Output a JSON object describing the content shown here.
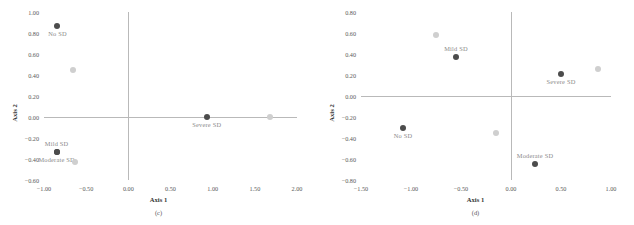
{
  "figure": {
    "panels": [
      {
        "caption": "(c)",
        "xlabel": "Axis 1",
        "ylabel": "Axis 2",
        "xticks": [
          "-1.00",
          "-0.50",
          "0.00",
          "0.50",
          "1.00",
          "1.50",
          "2.00"
        ],
        "yticks": [
          "1.00",
          "0.80",
          "0.60",
          "0.40",
          "0.20",
          "0.00",
          "-0.20",
          "-0.40",
          "-0.60"
        ]
      },
      {
        "caption": "(d)",
        "xlabel": "Axis 1",
        "ylabel": "Axis 2",
        "xticks": [
          "-1.50",
          "-1.00",
          "-0.50",
          "0.00",
          "0.50",
          "1.00"
        ],
        "yticks": [
          "0.80",
          "0.60",
          "0.40",
          "0.20",
          "0.00",
          "-0.20",
          "-0.40",
          "-0.60",
          "-0.80"
        ]
      }
    ]
  },
  "chart_data": [
    {
      "type": "scatter",
      "title": "",
      "subtitle": "(c)",
      "xlabel": "Axis 1",
      "ylabel": "Axis 2",
      "xlim": [
        -1.0,
        2.0
      ],
      "ylim": [
        -0.6,
        1.0
      ],
      "xticks": [
        -1.0,
        -0.5,
        0.0,
        0.5,
        1.0,
        1.5,
        2.0
      ],
      "yticks": [
        1.0,
        0.8,
        0.6,
        0.4,
        0.2,
        0.0,
        -0.2,
        -0.4,
        -0.6
      ],
      "grid": false,
      "legend": "none",
      "series": [
        {
          "name": "SD category",
          "marker": "filled-circle",
          "color": "#4c4c4c",
          "points": [
            {
              "label": "No SD",
              "x": -0.84,
              "y": 0.87,
              "label_pos": "below"
            },
            {
              "label": "Mild SD",
              "x": -0.85,
              "y": -0.33,
              "label_pos": "above"
            },
            {
              "label": "Moderate SD",
              "x": -0.85,
              "y": -0.33,
              "label_pos": "below"
            },
            {
              "label": "Severe SD",
              "x": 0.93,
              "y": 0.0,
              "label_pos": "below"
            }
          ]
        },
        {
          "name": "Unlabeled points",
          "marker": "filled-circle",
          "color": "#cfcfcf",
          "points": [
            {
              "label": "",
              "x": -0.66,
              "y": 0.45,
              "label_pos": "below"
            },
            {
              "label": "",
              "x": -0.63,
              "y": -0.43,
              "label_pos": "below"
            },
            {
              "label": "",
              "x": 1.68,
              "y": 0.0,
              "label_pos": "below"
            }
          ]
        }
      ]
    },
    {
      "type": "scatter",
      "title": "",
      "subtitle": "(d)",
      "xlabel": "Axis 1",
      "ylabel": "Axis 2",
      "xlim": [
        -1.5,
        1.0
      ],
      "ylim": [
        -0.8,
        0.8
      ],
      "xticks": [
        -1.5,
        -1.0,
        -0.5,
        0.0,
        0.5,
        1.0
      ],
      "yticks": [
        0.8,
        0.6,
        0.4,
        0.2,
        0.0,
        -0.2,
        -0.4,
        -0.6,
        -0.8
      ],
      "grid": false,
      "legend": "none",
      "series": [
        {
          "name": "SD category",
          "marker": "filled-circle",
          "color": "#4c4c4c",
          "points": [
            {
              "label": "Mild SD",
              "x": -0.55,
              "y": 0.37,
              "label_pos": "above"
            },
            {
              "label": "Severe SD",
              "x": 0.5,
              "y": 0.21,
              "label_pos": "below"
            },
            {
              "label": "No SD",
              "x": -1.08,
              "y": -0.3,
              "label_pos": "below"
            },
            {
              "label": "Moderate SD",
              "x": 0.24,
              "y": -0.65,
              "label_pos": "above"
            }
          ]
        },
        {
          "name": "Unlabeled points",
          "marker": "filled-circle",
          "color": "#cfcfcf",
          "points": [
            {
              "label": "",
              "x": -0.75,
              "y": 0.58,
              "label_pos": "above"
            },
            {
              "label": "",
              "x": 0.87,
              "y": 0.26,
              "label_pos": "above"
            },
            {
              "label": "",
              "x": -0.15,
              "y": -0.35,
              "label_pos": "above"
            }
          ]
        }
      ]
    }
  ]
}
